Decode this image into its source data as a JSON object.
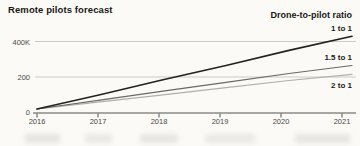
{
  "header": {
    "title": "Remote pilots forecast"
  },
  "legend": {
    "title": "Drone-to-pilot ratio"
  },
  "chart_data": {
    "type": "line",
    "title": "Remote pilots forecast",
    "legend_title": "Drone-to-pilot ratio",
    "legend_position": "line-end-labels-right",
    "grid": "horizontal-only",
    "x": [
      2016,
      2017,
      2018,
      2019,
      2020,
      2021
    ],
    "x_labels": [
      "2016",
      "2017",
      "2018",
      "2019",
      "2020",
      "2021"
    ],
    "y_tick_labels": [
      "400K",
      "200",
      "0"
    ],
    "y_ticks_k": [
      400,
      200,
      0
    ],
    "ylim_k": [
      0,
      470
    ],
    "unit": "remote pilots",
    "series": [
      {
        "name": "1 to 1",
        "color": "#232220",
        "width": 1.6,
        "label_top": 24,
        "values_k": [
          20,
          100,
          185,
          265,
          350,
          430
        ]
      },
      {
        "name": "1.5 to 1",
        "color": "#6a6964",
        "width": 1.2,
        "label_top": 53,
        "values_k": [
          20,
          70,
          120,
          170,
          220,
          265
        ]
      },
      {
        "name": "2 to 1",
        "color": "#b0afab",
        "width": 1.2,
        "label_top": 81,
        "values_k": [
          20,
          60,
          100,
          140,
          180,
          215
        ]
      }
    ],
    "layout": {
      "x_start_px": 37,
      "x_tick_step_px": 61,
      "line_end_px": 352,
      "axis_start_px": 33,
      "axis_end_px": 356,
      "y_zero_px": 112.5,
      "px_per_k": 0.1775,
      "y_label_tops_px": [
        37.5,
        73,
        108
      ]
    },
    "colors": {
      "background": "#fbfaf7",
      "gridline": "#cbcac6",
      "axis": "#55534d",
      "title_text": "#191815",
      "tick_text": "#4a4944"
    }
  }
}
